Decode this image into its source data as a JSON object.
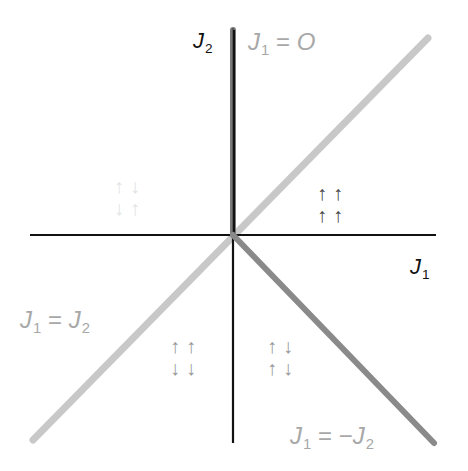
{
  "diagram": {
    "axes": {
      "x_label": {
        "base": "J",
        "sub": "1"
      },
      "y_label": {
        "base": "J",
        "sub": "2"
      },
      "color": "#111111"
    },
    "lines": [
      {
        "name": "J1=0",
        "label_parts": {
          "lhs_base": "J",
          "lhs_sub": "1",
          "eq": " = ",
          "rhs": "O"
        },
        "color": "#555555",
        "thickness": "thick"
      },
      {
        "name": "J1=J2",
        "label_parts": {
          "lhs_base": "J",
          "lhs_sub": "1",
          "eq": " = ",
          "rhs_base": "J",
          "rhs_sub": "2"
        },
        "color": "#c8c8c8",
        "thickness": "medium"
      },
      {
        "name": "J1=-J2",
        "label_parts": {
          "lhs_base": "J",
          "lhs_sub": "1",
          "eq": " = −",
          "rhs_base": "J",
          "rhs_sub": "2"
        },
        "color": "#8a8a8a",
        "thickness": "medium"
      }
    ],
    "quadrants": {
      "upper_right": {
        "row1": "↑↑",
        "row2": "↑↑",
        "color": "#444444"
      },
      "upper_left": {
        "row1": "↑↓",
        "row2": "↓↑",
        "color": "#e4e4e4"
      },
      "lower_left": {
        "row1": "↑↑",
        "row2": "↓↓",
        "color": "#9a9a9a"
      },
      "lower_right": {
        "row1": "↑↓",
        "row2": "↑↓",
        "color": "#9a9a9a"
      }
    }
  }
}
